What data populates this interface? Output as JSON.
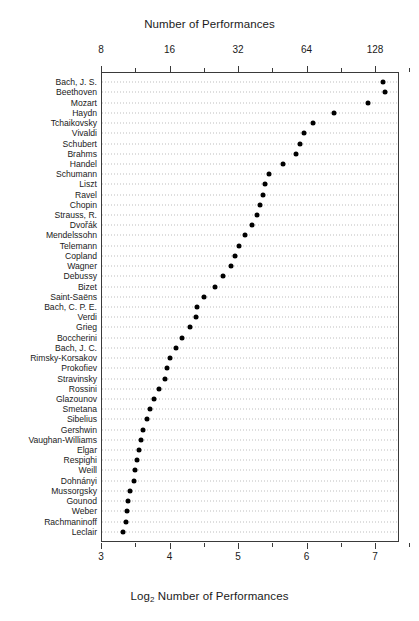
{
  "chart_data": {
    "type": "scatter",
    "title": "Number of Performances",
    "xlabel": "Log2 Number of Performances",
    "xlabel_prefix": "Log",
    "xlabel_sub": "2",
    "xlabel_suffix": " Number of Performances",
    "ylabel": "",
    "top_axis": {
      "label": "Number of Performances",
      "tick_labels": [
        "8",
        "16",
        "32",
        "64",
        "128"
      ],
      "tick_values": [
        3,
        4,
        5,
        6,
        7
      ]
    },
    "bottom_axis": {
      "label": "Log2 Number of Performances",
      "tick_labels": [
        "3",
        "4",
        "5",
        "6",
        "7"
      ],
      "tick_values": [
        3,
        4,
        5,
        6,
        7
      ]
    },
    "xlim": [
      2.85,
      7.35
    ],
    "grid": true,
    "grid_style": "dotted",
    "legend": "none",
    "dot_color": "#000000",
    "categories": [
      "Bach, J. S.",
      "Beethoven",
      "Mozart",
      "Haydn",
      "Tchaikovsky",
      "Vivaldi",
      "Schubert",
      "Brahms",
      "Handel",
      "Schumann",
      "Liszt",
      "Ravel",
      "Chopin",
      "Strauss, R.",
      "Dvořák",
      "Mendelssohn",
      "Telemann",
      "Copland",
      "Wagner",
      "Debussy",
      "Bizet",
      "Saint-Saëns",
      "Bach, C. P. E.",
      "Verdi",
      "Grieg",
      "Boccherini",
      "Bach, J. C.",
      "Rimsky-Korsakov",
      "Prokofiev",
      "Stravinsky",
      "Rossini",
      "Glazounov",
      "Smetana",
      "Sibelius",
      "Gershwin",
      "Vaughan-Williams",
      "Elgar",
      "Respighi",
      "Weill",
      "Dohnányi",
      "Mussorgsky",
      "Gounod",
      "Weber",
      "Rachmaninoff",
      "Leclair"
    ],
    "values": [
      7.12,
      7.14,
      6.9,
      6.4,
      6.1,
      5.97,
      5.9,
      5.84,
      5.65,
      5.45,
      5.4,
      5.36,
      5.32,
      5.28,
      5.2,
      5.1,
      5.02,
      4.95,
      4.9,
      4.78,
      4.66,
      4.5,
      4.4,
      4.38,
      4.3,
      4.18,
      4.1,
      4.0,
      3.97,
      3.93,
      3.85,
      3.78,
      3.72,
      3.67,
      3.62,
      3.58,
      3.55,
      3.52,
      3.5,
      3.48,
      3.42,
      3.4,
      3.38,
      3.36,
      3.32
    ],
    "performances": [
      139,
      141,
      119,
      84,
      69,
      63,
      60,
      57,
      50,
      44,
      42,
      41,
      40,
      39,
      37,
      34,
      32,
      31,
      30,
      27,
      25,
      23,
      21,
      21,
      20,
      18,
      17,
      16,
      16,
      15,
      14,
      14,
      13,
      13,
      12,
      12,
      12,
      11,
      11,
      11,
      11,
      11,
      10,
      10,
      10
    ]
  }
}
